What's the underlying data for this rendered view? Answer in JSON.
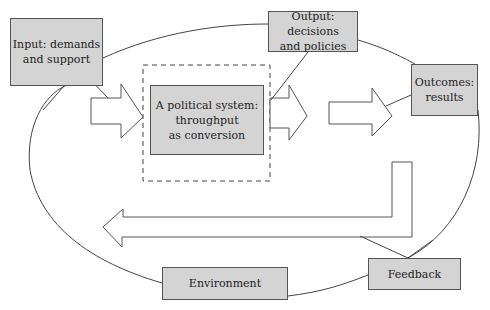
{
  "diagram": {
    "nodes": {
      "input": {
        "label": "Input: demands\nand support"
      },
      "output": {
        "label": "Output: decisions\nand policies"
      },
      "outcomes": {
        "label": "Outcomes:\nresults"
      },
      "system": {
        "label": "A political system:\nthroughput\nas conversion"
      },
      "environment": {
        "label": "Environment"
      },
      "feedback": {
        "label": "Feedback"
      }
    },
    "edges": [
      {
        "from": "input",
        "to": "system",
        "type": "block-arrow"
      },
      {
        "from": "system",
        "to": "output",
        "type": "block-arrow"
      },
      {
        "from": "output",
        "to": "outcomes",
        "type": "block-arrow"
      },
      {
        "from": "outcomes",
        "to": "input",
        "type": "feedback-loop-arrow",
        "via": "feedback"
      }
    ],
    "enclosure": {
      "shape": "ellipse",
      "represents": "environment"
    },
    "boundary": {
      "shape": "dashed-rectangle",
      "around": "system"
    },
    "colors": {
      "box_fill": "#d4d4d4",
      "box_stroke": "#555555",
      "line": "#444444",
      "background": "#ffffff"
    }
  }
}
